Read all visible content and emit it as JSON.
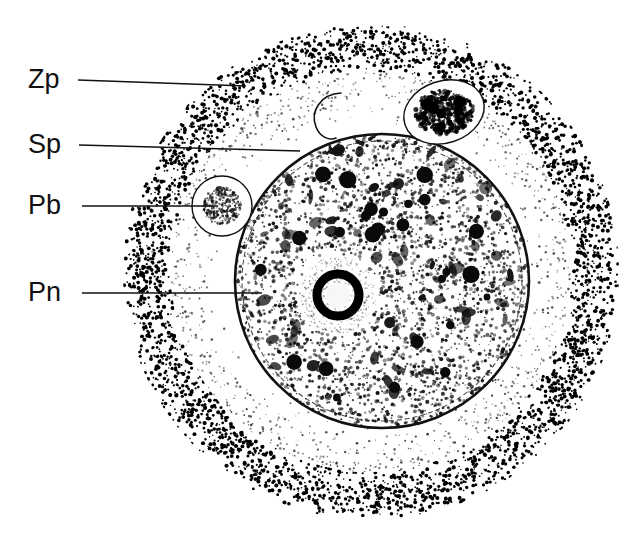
{
  "figure": {
    "kind": "scientific-line-drawing",
    "background_color": "#ffffff",
    "ink_color": "#111111",
    "width": 641,
    "height": 547
  },
  "labels": [
    {
      "id": "zp",
      "text": "Zp",
      "name": "zona-pellucida",
      "x": 28,
      "y": 66,
      "leader": {
        "x1": 78,
        "y1": 80,
        "x2": 246,
        "y2": 86
      }
    },
    {
      "id": "sp",
      "text": "Sp",
      "name": "sperm",
      "x": 28,
      "y": 131,
      "leader": {
        "x1": 79,
        "y1": 145,
        "x2": 300,
        "y2": 151
      }
    },
    {
      "id": "pb",
      "text": "Pb",
      "name": "polar-body",
      "x": 28,
      "y": 192,
      "leader": {
        "x1": 82,
        "y1": 206,
        "x2": 218,
        "y2": 206
      }
    },
    {
      "id": "pn",
      "text": "Pn",
      "name": "pronucleus",
      "x": 28,
      "y": 279,
      "leader": {
        "x1": 82,
        "y1": 293,
        "x2": 262,
        "y2": 293
      }
    }
  ],
  "structures": {
    "zona_pellucida": {
      "name": "zona-pellucida-ring",
      "center": {
        "cx": 371,
        "cy": 272
      },
      "outer_radius": 248,
      "inner_radius": 200,
      "fill": "#000000",
      "description": "dense coarse stipple annulus"
    },
    "perivitelline_space": {
      "name": "perivitelline-space",
      "center": {
        "cx": 371,
        "cy": 272
      },
      "outer_radius": 200,
      "inner_radius": 148,
      "fill": "#ffffff",
      "description": "pale fine stipple, lighter toward ooplasm"
    },
    "oocyte": {
      "name": "oocyte-body",
      "center": {
        "cx": 382,
        "cy": 281
      },
      "radius": 147,
      "membrane_stroke": "#111111",
      "description": "granular ooplasm with dark yolk granules"
    },
    "pronucleus": {
      "name": "pronucleus",
      "center": {
        "cx": 338,
        "cy": 295
      },
      "halo_radius": 39,
      "nucleolus_outer_radius": 21,
      "nucleolus_inner_radius": 12,
      "description": "pale halo with dark ring-shaped nucleolus"
    },
    "polar_body_left": {
      "name": "polar-body-left",
      "center": {
        "cx": 222,
        "cy": 206
      },
      "outer_radius": 30,
      "core_radius": 19,
      "description": "round body, pale rim, stippled core"
    },
    "polar_body_upper_right": {
      "name": "polar-body-upper-right",
      "center": {
        "cx": 444,
        "cy": 112
      },
      "rx": 41,
      "ry": 31,
      "rotation": -18,
      "description": "oval body, pale rim, coarse dark chromatin"
    },
    "sperm_tail": {
      "name": "sperm-tail",
      "description": "curved crescent/hook within perivitelline space",
      "path": "M 341 93 C 320 94 310 112 316 127 C 320 137 329 141 336 138"
    }
  },
  "texture": {
    "zona_dot_count": 4200,
    "perivitelline_dot_count": 1500,
    "ooplasm_dot_count": 3000,
    "granule_count": 26
  }
}
